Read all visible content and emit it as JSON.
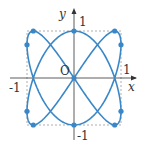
{
  "figure": {
    "curve": "x = sin(2t), y = cos(3t)",
    "color": "#3a87c8",
    "labels": {
      "x_axis": "x",
      "y_axis": "y",
      "origin": "O",
      "x_pos": "1",
      "x_neg": "-1",
      "y_pos": "1",
      "y_neg": "-1"
    },
    "points": [
      [
        0,
        1
      ],
      [
        0.866,
        1
      ],
      [
        -0.866,
        1
      ],
      [
        0,
        -1
      ],
      [
        0.866,
        -1
      ],
      [
        -0.866,
        -1
      ],
      [
        1,
        0.707
      ],
      [
        1,
        -0.707
      ],
      [
        -1,
        0.707
      ],
      [
        -1,
        -0.707
      ],
      [
        0,
        0
      ]
    ]
  }
}
